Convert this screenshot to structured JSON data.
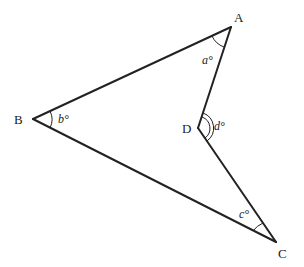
{
  "figure": {
    "type": "geometry-diagram",
    "vertices": [
      {
        "id": "A",
        "label": "A",
        "x": 231,
        "y": 27
      },
      {
        "id": "B",
        "label": "B",
        "x": 33,
        "y": 119
      },
      {
        "id": "C",
        "label": "C",
        "x": 276,
        "y": 242
      },
      {
        "id": "D",
        "label": "D",
        "x": 198,
        "y": 128
      }
    ],
    "edges": [
      [
        "A",
        "B"
      ],
      [
        "B",
        "C"
      ],
      [
        "C",
        "D"
      ],
      [
        "D",
        "A"
      ]
    ],
    "angles": [
      {
        "vertex": "A",
        "label": "a°",
        "arcs": 1
      },
      {
        "vertex": "B",
        "label": "b°",
        "arcs": 1
      },
      {
        "vertex": "C",
        "label": "c°",
        "arcs": 1
      },
      {
        "vertex": "D",
        "label": "d°",
        "arcs": 2,
        "reflex_side": "interior facing right"
      }
    ],
    "stroke_color": "#222222",
    "background": "#ffffff"
  }
}
